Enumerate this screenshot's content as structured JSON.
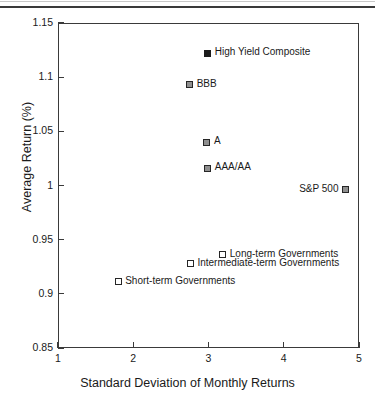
{
  "figure": {
    "page_rule": "horizontal-rule"
  },
  "chart_data": {
    "type": "scatter",
    "title": "",
    "xlabel": "Standard Deviation of Monthly Returns",
    "ylabel": "Average Return (%)",
    "xlim": [
      1,
      5
    ],
    "ylim": [
      0.85,
      1.15
    ],
    "grid": false,
    "legend": "none-inline-labels",
    "xticks": [
      "1",
      "2",
      "3",
      "4",
      "5"
    ],
    "xtick_values": [
      1,
      2,
      3,
      4,
      5
    ],
    "yticks": [
      "1.15",
      "1.1",
      "1.05",
      "1",
      "0.95",
      "0.9",
      "0.85"
    ],
    "ytick_values": [
      1.15,
      1.1,
      1.05,
      1.0,
      0.95,
      0.9,
      0.85
    ],
    "points": [
      {
        "label": "High Yield Composite",
        "x": 2.99,
        "y": 1.122,
        "marker": "solid",
        "label_side": "right"
      },
      {
        "label": "BBB",
        "x": 2.75,
        "y": 1.093,
        "marker": "shaded",
        "label_side": "right"
      },
      {
        "label": "A",
        "x": 2.98,
        "y": 1.04,
        "marker": "shaded",
        "label_side": "right"
      },
      {
        "label": "AAA/AA",
        "x": 2.99,
        "y": 1.016,
        "marker": "shaded",
        "label_side": "right"
      },
      {
        "label": "S&P 500",
        "x": 4.82,
        "y": 0.996,
        "marker": "shaded",
        "label_side": "left"
      },
      {
        "label": "Long-term Governments",
        "x": 3.19,
        "y": 0.936,
        "marker": "open",
        "label_side": "right"
      },
      {
        "label": "Intermediate-term Governments",
        "x": 2.76,
        "y": 0.928,
        "marker": "open",
        "label_side": "right"
      },
      {
        "label": "Short-term Governments",
        "x": 1.8,
        "y": 0.911,
        "marker": "open",
        "label_side": "right"
      }
    ],
    "colors": {
      "axis": "#3a3a3a",
      "text": "#1a1a1a",
      "marker_solid": "#1c1c1c",
      "marker_shaded": "#8f8f8f",
      "marker_open": "#ffffff"
    }
  }
}
